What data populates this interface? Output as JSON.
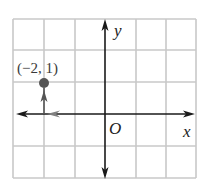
{
  "figure": {
    "type": "coordinate-plane",
    "grid": {
      "x_min": -3,
      "x_max": 3,
      "y_min": -2,
      "y_max": 3,
      "cell_px": 30.5,
      "origin_px": [
        105,
        114
      ],
      "color": "#c8c8c8"
    },
    "axes": {
      "x_label": "x",
      "y_label": "y",
      "origin_label": "O",
      "color": "#1a1a1a"
    },
    "point": {
      "label": "(−2, 1)",
      "x": -2,
      "y": 1,
      "color": "#555555"
    },
    "path_arrows": {
      "color": "#777777",
      "segments": [
        {
          "from": [
            0,
            0
          ],
          "to": [
            -2,
            0
          ],
          "description": "move left 2 units"
        },
        {
          "from": [
            -2,
            0
          ],
          "to": [
            -2,
            1
          ],
          "description": "move up 1 unit"
        }
      ]
    }
  }
}
